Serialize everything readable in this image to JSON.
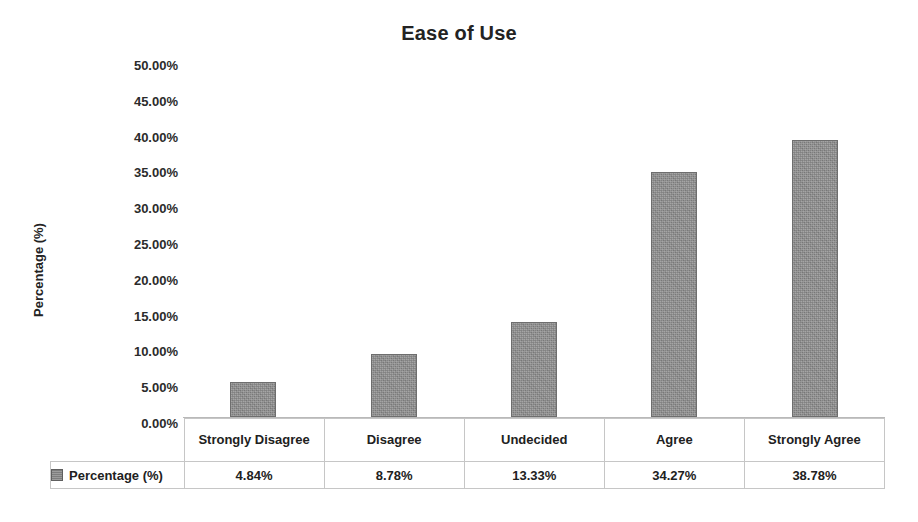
{
  "chart_data": {
    "type": "bar",
    "title": "Ease of Use",
    "xlabel": "",
    "ylabel": "Percentage (%)",
    "categories": [
      "Strongly Disagree",
      "Disagree",
      "Undecided",
      "Agree",
      "Strongly Agree"
    ],
    "values": [
      4.84,
      8.78,
      13.33,
      34.27,
      38.78
    ],
    "value_labels": [
      "4.84%",
      "8.78%",
      "13.33%",
      "34.27%",
      "38.78%"
    ],
    "series": [
      {
        "name": "Percentage (%)",
        "values": [
          4.84,
          8.78,
          13.33,
          34.27,
          38.78
        ],
        "color": "#8b8b8b"
      }
    ],
    "ylim": [
      0,
      50
    ],
    "ytick_step": 5,
    "ytick_labels": [
      "50.00%",
      "45.00%",
      "40.00%",
      "35.00%",
      "30.00%",
      "25.00%",
      "20.00%",
      "15.00%",
      "10.00%",
      "5.00%",
      "0.00%"
    ],
    "grid": false,
    "legend_position": "bottom-table",
    "legend": [
      {
        "label": "Percentage (%)",
        "swatch_icon": "series-swatch-icon",
        "color": "#8b8b8b"
      }
    ],
    "data_table": {
      "row_header": "Percentage (%)",
      "columns": [
        "Strongly Disagree",
        "Disagree",
        "Undecided",
        "Agree",
        "Strongly Agree"
      ],
      "rows": [
        {
          "label": "Percentage (%)",
          "cells": [
            "4.84%",
            "8.78%",
            "13.33%",
            "34.27%",
            "38.78%"
          ]
        }
      ]
    },
    "colors": {
      "bar_fill": "#8b8b8b",
      "bar_border": "#6e6e6e",
      "axis_line": "#b9b9b9",
      "table_border": "#c6c6c6",
      "text": "#212121",
      "background": "#ffffff"
    }
  }
}
